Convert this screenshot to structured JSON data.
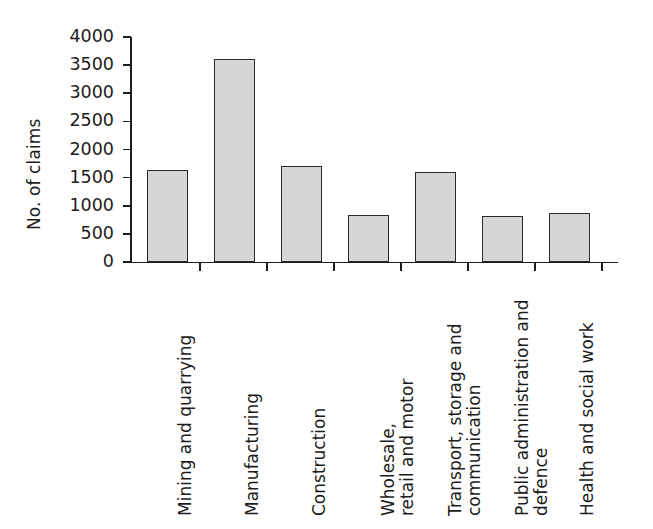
{
  "chart_data": {
    "type": "bar",
    "title": "",
    "xlabel": "",
    "ylabel": "No. of claims",
    "ylim": [
      0,
      4000
    ],
    "grid": false,
    "legend": null,
    "y_ticks": [
      0,
      500,
      1000,
      1500,
      2000,
      2500,
      3000,
      3500,
      4000
    ],
    "y_tick_labels": [
      "0",
      "500",
      "1000",
      "1500",
      "2000",
      "2500",
      "3000",
      "3500",
      "4000"
    ],
    "categories": [
      "Mining and quarrying",
      "Manufacturing",
      "Construction",
      "Wholesale, retail and motor",
      "Transport, storage and communication",
      "Public administration and defence",
      "Health and social work"
    ],
    "category_lines": [
      [
        "Mining and quarrying"
      ],
      [
        "Manufacturing"
      ],
      [
        "Construction"
      ],
      [
        "Wholesale,",
        "retail and motor"
      ],
      [
        "Transport, storage and",
        "communication"
      ],
      [
        "Public administration and",
        "defence"
      ],
      [
        "Health and social work"
      ]
    ],
    "values": [
      1630,
      3610,
      1700,
      840,
      1600,
      820,
      880
    ],
    "bar_fill_color": "#d6d6d6",
    "bar_edge_color": "#2b2b2b",
    "axis_color": "#1c1c1c",
    "background_color": "#ffffff"
  }
}
